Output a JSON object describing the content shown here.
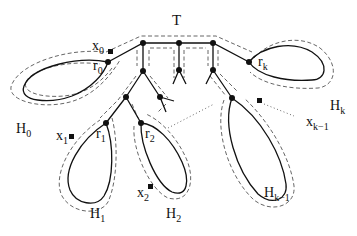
{
  "diagram": {
    "type": "tree-with-loops",
    "tree_label": "T",
    "loops": [
      {
        "id": "H0",
        "label": "H",
        "sub": "0",
        "root": "r",
        "root_sub": "0",
        "point": "x",
        "point_sub": "0"
      },
      {
        "id": "H1",
        "label": "H",
        "sub": "1",
        "root": "r",
        "root_sub": "1",
        "point": "x",
        "point_sub": "1"
      },
      {
        "id": "H2",
        "label": "H",
        "sub": "2",
        "root": "r",
        "root_sub": "2",
        "point": "x",
        "point_sub": "2"
      },
      {
        "id": "Hk-1",
        "label": "H",
        "sub": "k−1",
        "point": "x",
        "point_sub": "k−1"
      },
      {
        "id": "Hk",
        "label": "H",
        "sub": "k",
        "root": "r",
        "root_sub": "k"
      }
    ],
    "colors": {
      "line": "#111111",
      "dashed": "#555555",
      "background": "#ffffff"
    }
  }
}
